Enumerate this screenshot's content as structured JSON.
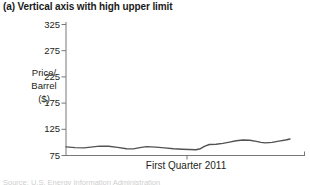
{
  "figure": {
    "title": "(a) Vertical axis with high upper limit",
    "source_caption": "Source: U.S. Energy Information Administration"
  },
  "axes": {
    "y_label_lines": [
      "Price/",
      "Barrel",
      "($)"
    ],
    "x_label": "First Quarter 2011"
  },
  "chart_data": {
    "type": "line",
    "title": "(a) Vertical axis with high upper limit",
    "xlabel": "First Quarter 2011",
    "ylabel": "Price/Barrel ($)",
    "ylim": [
      75,
      325
    ],
    "y_ticks": [
      325,
      275,
      225,
      175,
      125,
      75
    ],
    "grid": false,
    "legend": "none",
    "series": [
      {
        "name": "Oil price per barrel, Q1 2011",
        "x_fraction": [
          0,
          0.04,
          0.08,
          0.12,
          0.15,
          0.19,
          0.23,
          0.27,
          0.3,
          0.33,
          0.36,
          0.4,
          0.44,
          0.48,
          0.52,
          0.55,
          0.58,
          0.6,
          0.62,
          0.64,
          0.67,
          0.7,
          0.73,
          0.76,
          0.79,
          0.82,
          0.85,
          0.87,
          0.89,
          0.92,
          0.95,
          0.98,
          1.0
        ],
        "values": [
          91.5,
          90,
          89.5,
          91.5,
          93,
          92.5,
          90.5,
          88,
          87.5,
          90,
          92,
          91,
          89.5,
          88,
          87,
          86.5,
          86,
          88,
          93,
          96,
          96.5,
          98,
          100.5,
          103,
          104.5,
          104,
          102,
          100,
          99,
          100,
          102.5,
          104.5,
          106.5
        ]
      }
    ],
    "colors": {
      "line": "#525254",
      "axis": "#77777a",
      "text": "#231f20",
      "background": "#ffffff"
    }
  }
}
